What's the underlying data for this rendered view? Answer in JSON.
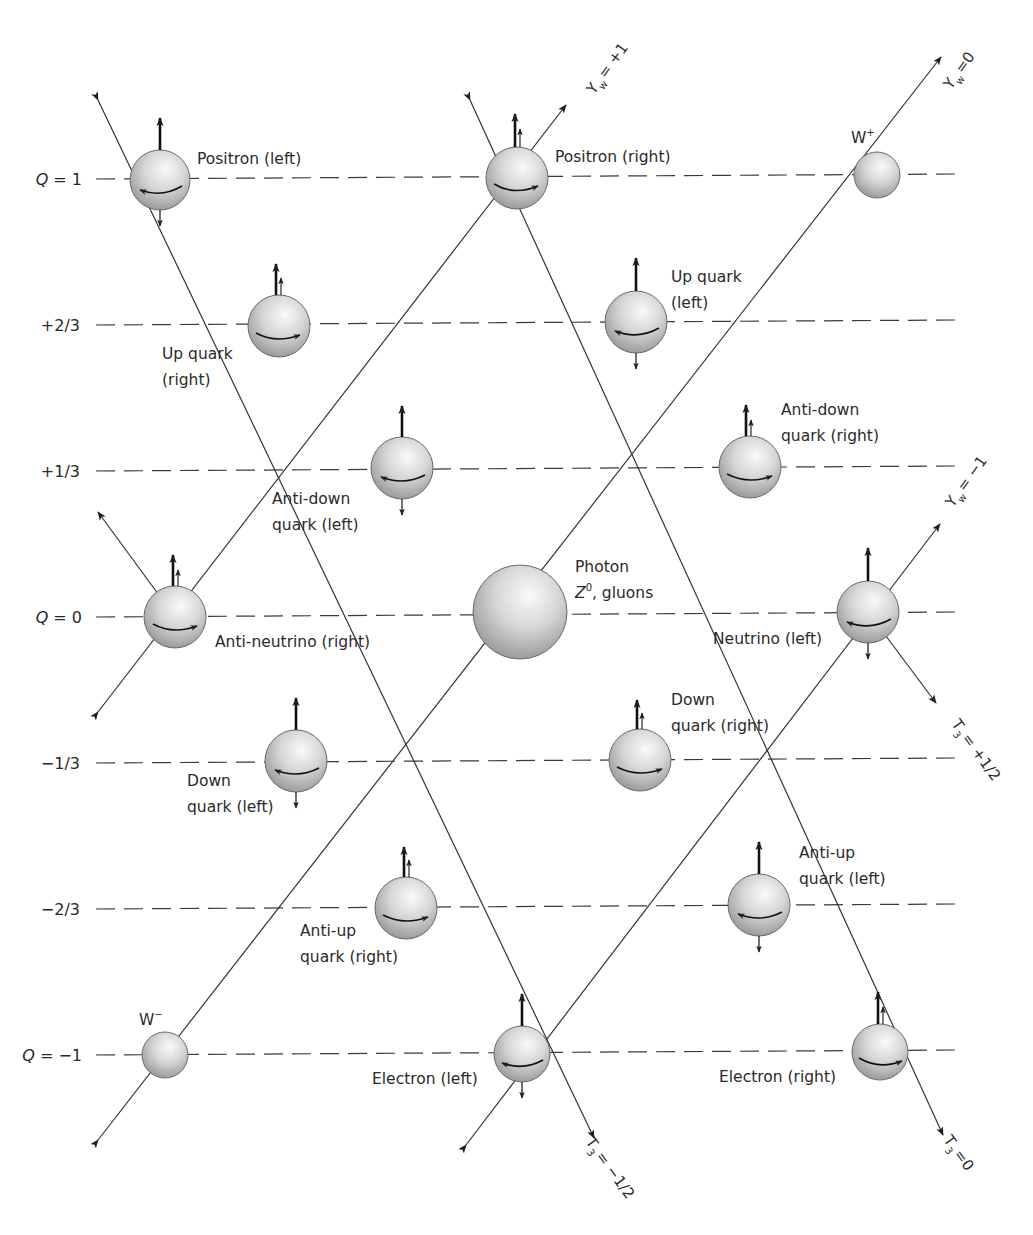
{
  "diagram": {
    "charge_levels": [
      {
        "label": "Q = 1",
        "value": "1",
        "y": 179
      },
      {
        "label": "+2/3",
        "value": "+2/3",
        "y": 325
      },
      {
        "label": "+1/3",
        "value": "+1/3",
        "y": 471
      },
      {
        "label": "Q = 0",
        "value": "0",
        "y": 617
      },
      {
        "label": "−1/3",
        "value": "-1/3",
        "y": 763
      },
      {
        "label": "−2/3",
        "value": "-2/3",
        "y": 909
      },
      {
        "label": "Q = −1",
        "value": "-1",
        "y": 1055
      }
    ],
    "axes": {
      "yw_plus1": "Y_w = +1",
      "yw_0": "Y_w = 0",
      "yw_minus1": "Y_w = −1",
      "t3_plus_half": "T_3 = +1/2",
      "t3_minus_half": "T_3 = −1/2",
      "t3_0": "T_3 = 0"
    },
    "axis_parts": {
      "Y": "Y",
      "w": "w",
      "T": "T",
      "three": "3",
      "yw_plus1_val": "= +1",
      "yw_0_val": "=0",
      "yw_minus1_val": "= −1",
      "t3_plus_half_val": "= +1/2",
      "t3_minus_half_val": "= −1/2",
      "t3_0_val": "=0"
    },
    "particles": [
      {
        "id": "positron-left",
        "name": "Positron (left)",
        "lines": [
          "Positron (left)"
        ],
        "charge": "1",
        "spin": "left"
      },
      {
        "id": "positron-right",
        "name": "Positron (right)",
        "lines": [
          "Positron (right)"
        ],
        "charge": "1",
        "spin": "right"
      },
      {
        "id": "w-plus",
        "name": "W+",
        "lines": [
          "W",
          "+"
        ],
        "charge": "1"
      },
      {
        "id": "up-quark-right",
        "name": "Up quark (right)",
        "lines": [
          "Up quark",
          "(right)"
        ],
        "charge": "+2/3",
        "spin": "right"
      },
      {
        "id": "up-quark-left",
        "name": "Up quark (left)",
        "lines": [
          "Up quark",
          "(left)"
        ],
        "charge": "+2/3",
        "spin": "left"
      },
      {
        "id": "anti-down-quark-left",
        "name": "Anti-down quark (left)",
        "lines": [
          "Anti-down",
          "quark (left)"
        ],
        "charge": "+1/3",
        "spin": "left"
      },
      {
        "id": "anti-down-quark-right",
        "name": "Anti-down quark (right)",
        "lines": [
          "Anti-down",
          "quark (right)"
        ],
        "charge": "+1/3",
        "spin": "right"
      },
      {
        "id": "anti-neutrino-right",
        "name": "Anti-neutrino (right)",
        "lines": [
          "Anti-neutrino (right)"
        ],
        "charge": "0",
        "spin": "right"
      },
      {
        "id": "photon",
        "name": "Photon Z0, gluons",
        "lines": [
          "Photon",
          "Z",
          "0",
          ", gluons"
        ],
        "charge": "0"
      },
      {
        "id": "neutrino-left",
        "name": "Neutrino (left)",
        "lines": [
          "Neutrino (left)"
        ],
        "charge": "0",
        "spin": "left"
      },
      {
        "id": "down-quark-left",
        "name": "Down quark (left)",
        "lines": [
          "Down",
          "quark (left)"
        ],
        "charge": "-1/3",
        "spin": "left"
      },
      {
        "id": "down-quark-right",
        "name": "Down quark (right)",
        "lines": [
          "Down",
          "quark (right)"
        ],
        "charge": "-1/3",
        "spin": "right"
      },
      {
        "id": "anti-up-quark-right",
        "name": "Anti-up quark (right)",
        "lines": [
          "Anti-up",
          "quark (right)"
        ],
        "charge": "-2/3",
        "spin": "right"
      },
      {
        "id": "anti-up-quark-left",
        "name": "Anti-up quark (left)",
        "lines": [
          "Anti-up",
          "quark (left)"
        ],
        "charge": "-2/3",
        "spin": "left"
      },
      {
        "id": "w-minus",
        "name": "W-",
        "lines": [
          "W",
          "−"
        ],
        "charge": "-1"
      },
      {
        "id": "electron-left",
        "name": "Electron (left)",
        "lines": [
          "Electron (left)"
        ],
        "charge": "-1",
        "spin": "left"
      },
      {
        "id": "electron-right",
        "name": "Electron (right)",
        "lines": [
          "Electron (right)"
        ],
        "charge": "-1",
        "spin": "right"
      }
    ],
    "colors": {
      "line": "#3a3a3a",
      "text": "#2a2a2a",
      "sphere_light": "#f4f4f4",
      "sphere_dark": "#8e8e8e",
      "background": "#ffffff"
    }
  }
}
